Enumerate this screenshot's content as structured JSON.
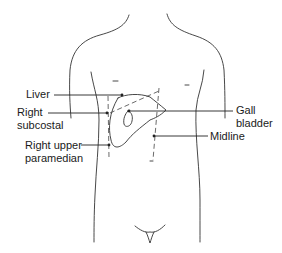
{
  "diagram": {
    "labels": {
      "liver": "Liver",
      "right_subcostal_1": "Right",
      "right_subcostal_2": "subcostal",
      "right_upper_paramedian_1": "Right upper",
      "right_upper_paramedian_2": "paramedian",
      "gall_bladder_1": "Gall",
      "gall_bladder_2": "bladder",
      "midline": "Midline"
    },
    "colors": {
      "line": "#333333",
      "text": "#1a1a1a",
      "background": "#ffffff"
    }
  }
}
